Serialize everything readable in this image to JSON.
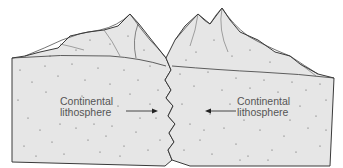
{
  "diagram": {
    "type": "continental-continental collision cross-section",
    "colors": {
      "background": "#ffffff",
      "crust_fill": "#e6e6e6",
      "outline": "#3a3a3a",
      "speckle": "#555555",
      "label_text": "#555555"
    },
    "labels": {
      "left": {
        "line1": "Continental",
        "line2": "lithosphere"
      },
      "right": {
        "line1": "Continental",
        "line2": "lithosphere"
      }
    },
    "arrows": {
      "left": {
        "direction": "right"
      },
      "right": {
        "direction": "left"
      }
    }
  }
}
